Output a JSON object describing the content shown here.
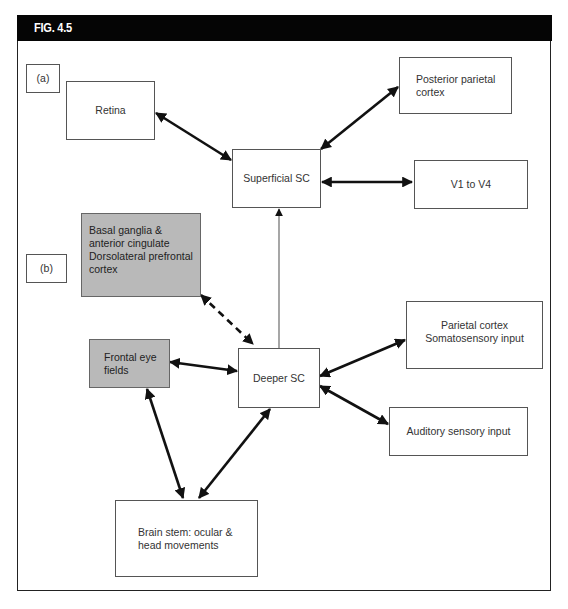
{
  "figure": {
    "title": "FIG. 4.5"
  },
  "panels": {
    "a_label": "(a)",
    "b_label": "(b)"
  },
  "nodes": {
    "retina": "Retina",
    "posterior_parietal": "Posterior parietal\ncortex",
    "superficial_sc": "Superficial SC",
    "v1_v4": "V1 to V4",
    "basal_ganglia": "Basal ganglia &\nanterior cingulate\nDorsolateral prefrontal\ncortex",
    "frontal_eye_fields": "Frontal eye\nfields",
    "deeper_sc": "Deeper SC",
    "parietal_somatosensory": "Parietal cortex\nSomatosensory input",
    "auditory": "Auditory sensory input",
    "brain_stem": "Brain stem: ocular &\nhead movements"
  },
  "colors": {
    "header_bg": "#050505",
    "grey_fill": "#b9b9b9",
    "arrow": "#111111",
    "thin_arrow": "#777777"
  },
  "edges": [
    {
      "from": "Retina",
      "to": "Superficial SC",
      "style": "bidirectional"
    },
    {
      "from": "Superficial SC",
      "to": "Posterior parietal cortex",
      "style": "bidirectional"
    },
    {
      "from": "Superficial SC",
      "to": "V1 to V4",
      "style": "bidirectional"
    },
    {
      "from": "Deeper SC",
      "to": "Superficial SC",
      "style": "thin-unidirectional"
    },
    {
      "from": "Basal ganglia & anterior cingulate Dorsolateral prefrontal cortex",
      "to": "Deeper SC",
      "style": "dashed-bidirectional"
    },
    {
      "from": "Frontal eye fields",
      "to": "Deeper SC",
      "style": "bidirectional"
    },
    {
      "from": "Deeper SC",
      "to": "Parietal cortex Somatosensory input",
      "style": "bidirectional"
    },
    {
      "from": "Deeper SC",
      "to": "Auditory sensory input",
      "style": "bidirectional"
    },
    {
      "from": "Frontal eye fields",
      "to": "Brain stem: ocular & head movements",
      "style": "bidirectional"
    },
    {
      "from": "Deeper SC",
      "to": "Brain stem: ocular & head movements",
      "style": "bidirectional"
    }
  ]
}
